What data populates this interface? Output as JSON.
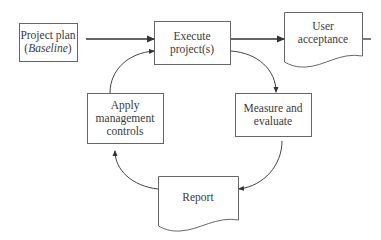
{
  "diagram": {
    "type": "flowchart",
    "nodes": {
      "project_plan": {
        "line1": "Project plan",
        "line2_open": "(",
        "line2_italic": "Baseline",
        "line2_close": ")",
        "shape": "rectangle"
      },
      "execute": {
        "line1": "Execute",
        "line2": "project(s)",
        "shape": "rectangle"
      },
      "user_acceptance": {
        "line1": "User",
        "line2": "acceptance",
        "shape": "document"
      },
      "measure": {
        "line1": "Measure and",
        "line2": "evaluate",
        "shape": "rectangle"
      },
      "report": {
        "line1": "Report",
        "shape": "document"
      },
      "apply": {
        "line1": "Apply",
        "line2": "management",
        "line3": "controls",
        "shape": "rectangle"
      }
    },
    "edges": [
      {
        "from": "Project plan (Baseline)",
        "to": "Execute project(s)",
        "style": "straight"
      },
      {
        "from": "Execute project(s)",
        "to": "User acceptance",
        "style": "straight"
      },
      {
        "from": "Execute project(s)",
        "to": "Measure and evaluate",
        "style": "curved"
      },
      {
        "from": "Measure and evaluate",
        "to": "Report",
        "style": "curved"
      },
      {
        "from": "Report",
        "to": "Apply management controls",
        "style": "curved"
      },
      {
        "from": "Apply management controls",
        "to": "Execute project(s)",
        "style": "curved"
      }
    ],
    "colors": {
      "stroke": "#555555",
      "text": "#3a3a3a",
      "background": "#ffffff"
    }
  }
}
